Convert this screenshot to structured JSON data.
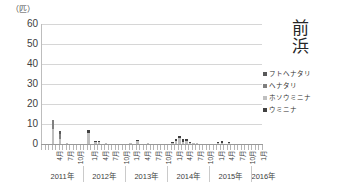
{
  "chart_data": {
    "type": "bar",
    "stacked": true,
    "title": "前浜",
    "title_chars": [
      "前",
      "浜"
    ],
    "ylabel": "（匹）",
    "xlabel": "",
    "ylim": [
      0,
      60
    ],
    "yticks": [
      60,
      50,
      40,
      30,
      20,
      10,
      0
    ],
    "grid": true,
    "legend_position": "right",
    "series": [
      {
        "name": "フトヘナタリ",
        "color": "#595959",
        "values": [
          0,
          0,
          0,
          0,
          0,
          1.5,
          0,
          0,
          0,
          0,
          0,
          0,
          0,
          0,
          0,
          0,
          0,
          0,
          0,
          0,
          0,
          0,
          0,
          0,
          0,
          0,
          0,
          0,
          0,
          0,
          0,
          0,
          0,
          0,
          0,
          0,
          0,
          0,
          0,
          0,
          0,
          0,
          0,
          0,
          0,
          0,
          0,
          0,
          0,
          0,
          0,
          0,
          0,
          0,
          0,
          0,
          0,
          0,
          0
        ]
      },
      {
        "name": "ヘナタリ",
        "color": "#7f7f7f",
        "values": [
          0,
          0,
          0,
          4.5,
          0,
          2.5,
          0,
          0,
          0,
          0,
          0,
          0,
          0,
          0,
          0,
          0,
          0,
          0,
          0,
          0,
          0,
          0,
          0,
          0,
          0,
          0,
          0,
          0,
          0,
          0,
          0,
          0,
          0,
          0,
          0,
          0,
          0,
          0,
          0,
          0,
          0,
          0,
          0,
          0,
          0,
          0,
          0,
          0,
          0,
          0,
          0,
          0,
          0,
          0,
          0,
          0,
          0,
          0,
          0
        ]
      },
      {
        "name": "ホソウミニナ",
        "color": "#bfbfbf",
        "values": [
          0,
          0,
          0,
          7.5,
          0,
          2.5,
          0,
          0.4,
          0,
          0,
          0,
          0,
          0,
          5.5,
          0,
          1.2,
          1.2,
          0,
          0.4,
          0,
          0,
          0,
          0,
          0,
          0,
          0.5,
          0,
          1.6,
          0,
          0,
          0.3,
          0,
          0,
          0,
          0,
          0,
          0,
          0.6,
          1.5,
          3.0,
          1.2,
          1.5,
          0.6,
          0.4,
          0.3,
          0,
          0,
          0,
          0,
          0,
          0.3,
          0.4,
          0,
          0.3,
          0,
          0,
          0,
          0,
          0
        ]
      },
      {
        "name": "ウミニナ",
        "color": "#404040",
        "values": [
          0,
          0,
          0,
          0,
          0,
          0,
          0,
          0,
          0,
          0,
          0,
          0,
          0,
          1.5,
          0,
          0.5,
          0.5,
          0,
          0,
          0,
          0,
          0,
          0,
          0,
          0,
          0,
          0,
          0.4,
          0,
          0,
          0,
          0,
          0,
          0,
          0,
          0,
          0,
          0.4,
          1.0,
          1.0,
          1.5,
          1.2,
          0.4,
          0,
          0,
          0,
          0,
          0,
          0,
          0,
          0.6,
          1.0,
          0,
          0.8,
          0,
          0,
          0,
          0,
          0
        ]
      }
    ],
    "month_ticks": [
      {
        "index": 3,
        "label": "4月"
      },
      {
        "index": 6,
        "label": "7月"
      },
      {
        "index": 9,
        "label": "10月"
      },
      {
        "index": 13,
        "label": "1月"
      },
      {
        "index": 16,
        "label": "4月"
      },
      {
        "index": 19,
        "label": "7月"
      },
      {
        "index": 22,
        "label": "10月"
      },
      {
        "index": 25,
        "label": "1月"
      },
      {
        "index": 28,
        "label": "4月"
      },
      {
        "index": 31,
        "label": "7月"
      },
      {
        "index": 34,
        "label": "10月"
      },
      {
        "index": 37,
        "label": "1月"
      },
      {
        "index": 40,
        "label": "4月"
      },
      {
        "index": 43,
        "label": "7月"
      },
      {
        "index": 46,
        "label": "10月"
      },
      {
        "index": 49,
        "label": "1月"
      },
      {
        "index": 52,
        "label": "4月"
      },
      {
        "index": 55,
        "label": "7月"
      },
      {
        "index": 58,
        "label": "10月"
      },
      {
        "index": 61,
        "label": "1月"
      }
    ],
    "year_groups": [
      {
        "label": "2011年",
        "start": 0,
        "end": 11
      },
      {
        "label": "2012年",
        "start": 12,
        "end": 23
      },
      {
        "label": "2013年",
        "start": 24,
        "end": 35
      },
      {
        "label": "2014年",
        "start": 36,
        "end": 47
      },
      {
        "label": "2015年",
        "start": 48,
        "end": 59
      },
      {
        "label": "2016年",
        "start": 60,
        "end": 62
      }
    ],
    "n_slots": 63
  }
}
